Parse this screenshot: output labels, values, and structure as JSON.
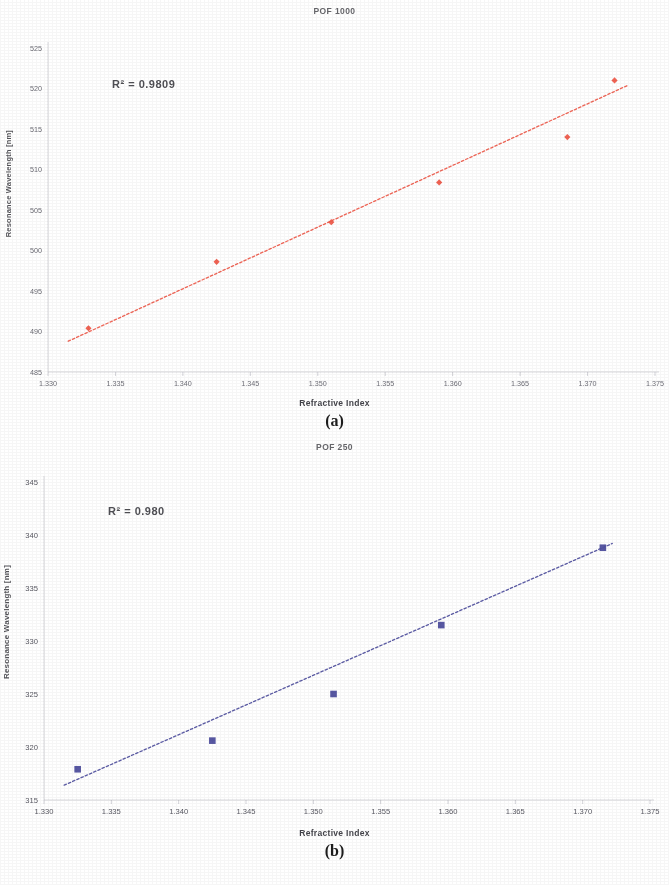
{
  "page": {
    "background": "#ffffff",
    "figure_a_caption": "(a)",
    "figure_b_caption": "(b)"
  },
  "chart_data": [
    {
      "id": "pof-1000",
      "type": "scatter",
      "title": "POF 1000",
      "xlabel": "Refractive Index",
      "ylabel": "Resonance Wavelength [nm]",
      "annotation": "R² = 0.9809",
      "series_color": "#ef5a4a",
      "marker": "diamond",
      "trendline": "dashed",
      "legend": "none",
      "grid": false,
      "xlim": [
        1.33,
        1.375
      ],
      "ylim": [
        485,
        525
      ],
      "xticks": [
        "1.330",
        "1.335",
        "1.340",
        "1.345",
        "1.350",
        "1.355",
        "1.360",
        "1.365",
        "1.370",
        "1.375"
      ],
      "xtick_values": [
        1.33,
        1.335,
        1.34,
        1.345,
        1.35,
        1.355,
        1.36,
        1.365,
        1.37,
        1.375
      ],
      "yticks": [
        "525",
        "520",
        "515",
        "510",
        "505",
        "500",
        "495",
        "490",
        "485"
      ],
      "ytick_values": [
        525,
        520,
        515,
        510,
        505,
        500,
        495,
        490,
        485
      ],
      "x": [
        1.333,
        1.3425,
        1.351,
        1.359,
        1.3685,
        1.372
      ],
      "y": [
        490.4,
        498.6,
        503.5,
        508.4,
        514.0,
        521.0
      ],
      "points": [
        {
          "x": 1.333,
          "y": 490.4
        },
        {
          "x": 1.3425,
          "y": 498.6
        },
        {
          "x": 1.351,
          "y": 503.5
        },
        {
          "x": 1.359,
          "y": 508.4
        },
        {
          "x": 1.3685,
          "y": 514.0
        },
        {
          "x": 1.372,
          "y": 521.0
        }
      ],
      "fit_endpoints": [
        {
          "x": 1.3315,
          "y": 488.8
        },
        {
          "x": 1.373,
          "y": 520.4
        }
      ]
    },
    {
      "id": "pof-250",
      "type": "scatter",
      "title": "POF 250",
      "xlabel": "Refractive Index",
      "ylabel": "Resonance Wavelength [nm]",
      "annotation": "R² = 0.980",
      "series_color": "#4f4f9e",
      "marker": "square",
      "trendline": "dashed",
      "legend": "none",
      "grid": false,
      "xlim": [
        1.33,
        1.375
      ],
      "ylim": [
        315,
        345
      ],
      "xticks": [
        "1.330",
        "1.335",
        "1.340",
        "1.345",
        "1.350",
        "1.355",
        "1.360",
        "1.365",
        "1.370",
        "1.375"
      ],
      "xtick_values": [
        1.33,
        1.335,
        1.34,
        1.345,
        1.35,
        1.355,
        1.36,
        1.365,
        1.37,
        1.375
      ],
      "yticks": [
        "345",
        "340",
        "335",
        "330",
        "325",
        "320",
        "315"
      ],
      "ytick_values": [
        345,
        340,
        335,
        330,
        325,
        320,
        315
      ],
      "x": [
        1.3325,
        1.3425,
        1.3515,
        1.3595,
        1.3715
      ],
      "y": [
        317.9,
        320.6,
        325.0,
        331.5,
        338.8
      ],
      "points": [
        {
          "x": 1.3325,
          "y": 317.9
        },
        {
          "x": 1.3425,
          "y": 320.6
        },
        {
          "x": 1.3515,
          "y": 325.0
        },
        {
          "x": 1.3595,
          "y": 331.5
        },
        {
          "x": 1.3715,
          "y": 338.8
        }
      ],
      "fit_endpoints": [
        {
          "x": 1.3315,
          "y": 316.4
        },
        {
          "x": 1.3722,
          "y": 339.2
        }
      ]
    }
  ]
}
